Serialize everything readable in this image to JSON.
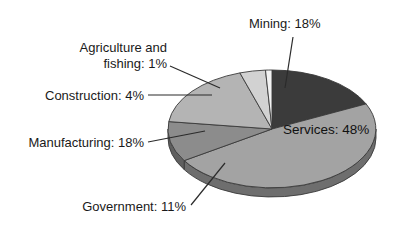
{
  "chart_data": {
    "type": "pie",
    "title": "",
    "subtitle": "",
    "xlabel": "",
    "ylabel": "",
    "legend_position": "none",
    "grid": false,
    "style": "3d-exploded-none-grayscale",
    "units": "percent",
    "total": 100,
    "categories": [
      "Mining",
      "Services",
      "Government",
      "Manufacturing",
      "Construction",
      "Agriculture and fishing"
    ],
    "values": [
      18,
      48,
      11,
      18,
      4,
      1
    ],
    "labels": [
      "Mining: 18%",
      "Services: 48%",
      "Government: 11%",
      "Manufacturing: 18%",
      "Construction: 4%",
      "Agriculture and\nfishing: 1%"
    ],
    "slices": [
      {
        "name": "Mining",
        "value": 18,
        "label": "Mining: 18%",
        "color": "#3b3b3b",
        "side_color": "#2a2a2a",
        "label_placement": "outside-top-right",
        "leader": true
      },
      {
        "name": "Services",
        "value": 48,
        "label": "Services: 48%",
        "color": "#a3a3a3",
        "side_color": "#6e6e6e",
        "label_placement": "inside",
        "leader": false
      },
      {
        "name": "Government",
        "value": 11,
        "label": "Government: 11%",
        "color": "#8c8c8c",
        "side_color": "#5f5f5f",
        "label_placement": "outside-bottom-left",
        "leader": true
      },
      {
        "name": "Manufacturing",
        "value": 18,
        "label": "Manufacturing: 18%",
        "color": "#b4b4b4",
        "side_color": "#7a7a7a",
        "label_placement": "outside-left",
        "leader": true
      },
      {
        "name": "Construction",
        "value": 4,
        "label": "Construction: 4%",
        "color": "#d2d2d2",
        "side_color": "#8e8e8e",
        "label_placement": "outside-left-upper",
        "leader": true
      },
      {
        "name": "Agriculture and fishing",
        "value": 1,
        "label": "Agriculture and fishing: 1%",
        "color": "#f2f2f2",
        "side_color": "#a0a0a0",
        "label_placement": "outside-top-left",
        "leader": true
      }
    ]
  },
  "labels": {
    "mining": "Mining: 18%",
    "services": "Services: 48%",
    "government": "Government: 11%",
    "manufacturing": "Manufacturing: 18%",
    "construction": "Construction: 4%",
    "agriculture_line1": "Agriculture and",
    "agriculture_line2": "fishing: 1%"
  },
  "colors": {
    "background": "#ffffff",
    "text": "#1a1a1a",
    "leader_line": "#2b2b2b",
    "mining": "#3b3b3b",
    "services": "#a3a3a3",
    "government": "#8c8c8c",
    "manufacturing": "#b4b4b4",
    "construction": "#d2d2d2",
    "agriculture": "#f2f2f2"
  }
}
